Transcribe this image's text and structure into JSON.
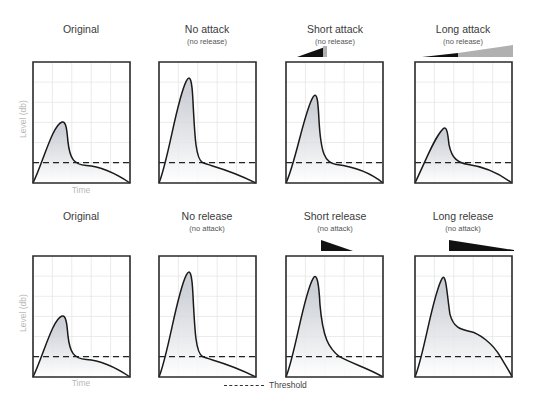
{
  "figure": {
    "rows": [
      {
        "panels": [
          {
            "title": "Original",
            "subtitle": "",
            "ylabel": "Level (db)",
            "xlabel": "Time"
          },
          {
            "title": "No attack",
            "subtitle": "(no release)"
          },
          {
            "title": "Short attack",
            "subtitle": "(no release)",
            "indicator": "short-attack-wedge"
          },
          {
            "title": "Long attack",
            "subtitle": "(no release)",
            "indicator": "long-attack-wedge"
          }
        ]
      },
      {
        "panels": [
          {
            "title": "Original",
            "subtitle": "",
            "ylabel": "Level (db)",
            "xlabel": "Time"
          },
          {
            "title": "No release",
            "subtitle": "(no attack)"
          },
          {
            "title": "Short release",
            "subtitle": "(no attack)",
            "indicator": "short-release-wedge"
          },
          {
            "title": "Long release",
            "subtitle": "(no attack)",
            "indicator": "long-release-wedge"
          }
        ]
      }
    ],
    "legend": {
      "label": "Threshold",
      "style": "dashed"
    },
    "colors": {
      "curve": "#1a1a1a",
      "frame": "#2a2a2a",
      "grid": "#e2e2e2",
      "fill_top": "#c4c8cf",
      "fill_bottom": "#ffffff",
      "wedge_dark": "#111111",
      "wedge_light": "#b0b0b0",
      "axis_label": "#b8b8b8"
    }
  },
  "chart_data": {
    "type": "line",
    "xlabel": "Time",
    "ylabel": "Level (db)",
    "grid": true,
    "grid_divisions": {
      "x": 5,
      "y": 6
    },
    "threshold_level_fraction": 0.17,
    "panels": [
      {
        "name": "Original",
        "peak_time": 0.31,
        "peak_level": 0.5,
        "description": "baseline envelope"
      },
      {
        "name": "No attack (no release)",
        "peak_time": 0.31,
        "peak_level": 0.83
      },
      {
        "name": "Short attack (no release)",
        "peak_time": 0.31,
        "peak_level": 0.7
      },
      {
        "name": "Long attack (no release)",
        "peak_time": 0.31,
        "peak_level": 0.55
      },
      {
        "name": "Original",
        "peak_time": 0.31,
        "peak_level": 0.5
      },
      {
        "name": "No release (no attack)",
        "peak_time": 0.31,
        "peak_level": 0.83
      },
      {
        "name": "Short release (no attack)",
        "peak_time": 0.31,
        "peak_level": 0.83
      },
      {
        "name": "Long release (no attack)",
        "peak_time": 0.31,
        "peak_level": 0.83
      }
    ],
    "legend": [
      "Threshold"
    ]
  }
}
